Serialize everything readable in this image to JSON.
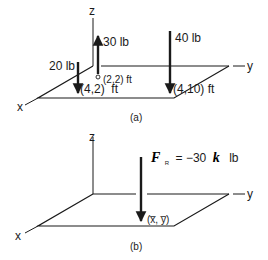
{
  "figure_a": {
    "caption": "(a)",
    "axes": {
      "x": "x",
      "y": "y",
      "z": "z"
    },
    "forces": [
      {
        "magnitude": "30 lb",
        "direction": "up",
        "location": "(2,2) ft"
      },
      {
        "magnitude": "20 lb",
        "direction": "down",
        "location": "(4,2)  ft"
      },
      {
        "magnitude": "40 lb",
        "direction": "down",
        "location": "(4,10) ft"
      }
    ]
  },
  "figure_b": {
    "caption": "(b)",
    "axes": {
      "x": "x",
      "y": "y",
      "z": "z"
    },
    "resultant": {
      "symbol": "F",
      "subscript": "R",
      "equation": "= −30",
      "unit_vector": "k",
      "unit": "lb",
      "location": "(x̅, y̅)"
    }
  },
  "colors": {
    "ink": "#1a1a1a",
    "background": "#ffffff"
  }
}
